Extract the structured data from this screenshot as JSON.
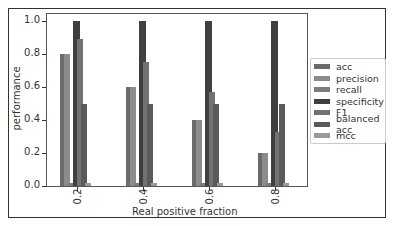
{
  "chart_data": {
    "type": "bar",
    "title": "",
    "xlabel": "Real positive fraction",
    "ylabel": "performance",
    "ylim": [
      0.0,
      1.05
    ],
    "yticks": [
      "0.0",
      "0.2",
      "0.4",
      "0.6",
      "0.8",
      "1.0"
    ],
    "categories": [
      "0.2",
      "0.4",
      "0.6",
      "0.8"
    ],
    "grid": false,
    "legend_position": "right-outside",
    "series": [
      {
        "name": "acc",
        "color": "#6b6b6b",
        "values": [
          0.8,
          0.6,
          0.4,
          0.2
        ]
      },
      {
        "name": "precision",
        "color": "#8c8c8c",
        "values": [
          0.8,
          0.6,
          0.4,
          0.2
        ]
      },
      {
        "name": "recall",
        "color": "#7d7d7d",
        "values": [
          0.02,
          0.02,
          0.02,
          0.02
        ]
      },
      {
        "name": "specificity",
        "color": "#3f3f3f",
        "values": [
          1.0,
          1.0,
          1.0,
          1.0
        ]
      },
      {
        "name": "F1",
        "color": "#727272",
        "values": [
          0.89,
          0.75,
          0.57,
          0.33
        ]
      },
      {
        "name": "balanced acc",
        "color": "#5a5a5a",
        "values": [
          0.5,
          0.5,
          0.5,
          0.5
        ]
      },
      {
        "name": "mcc",
        "color": "#9a9a9a",
        "values": [
          0.02,
          0.02,
          0.02,
          0.02
        ]
      }
    ]
  }
}
